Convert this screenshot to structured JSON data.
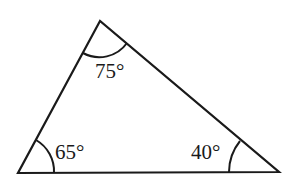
{
  "diagram": {
    "type": "triangle",
    "stroke_color": "#1a1a1a",
    "vertices": {
      "top": [
        100,
        21
      ],
      "bottom_left": [
        18,
        173
      ],
      "bottom_right": [
        279,
        172
      ]
    },
    "angles": [
      {
        "vertex": "top",
        "label": "75°",
        "value": 75
      },
      {
        "vertex": "bottom_left",
        "label": "65°",
        "value": 65
      },
      {
        "vertex": "bottom_right",
        "label": "40°",
        "value": 40
      }
    ]
  }
}
